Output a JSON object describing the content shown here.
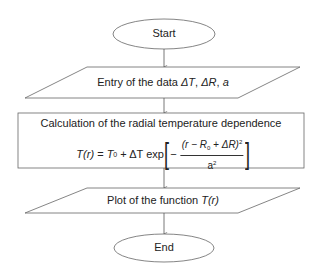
{
  "flowchart": {
    "nodes": [
      {
        "id": "start",
        "shape": "terminator",
        "label": "Start"
      },
      {
        "id": "input",
        "shape": "input-output",
        "label": "Entry of the data ΔT, ΔR, a",
        "label_parts": {
          "prefix": "Entry of the data ",
          "var1": "ΔT",
          "sep1": ", ",
          "var2": "ΔR",
          "sep2": ", ",
          "var3": "a"
        }
      },
      {
        "id": "process",
        "shape": "process",
        "label": "Calculation of the radial temperature dependence",
        "formula": {
          "lhs": "T(r)",
          "equals": " = ",
          "t0": "T",
          "t0_sub": "0",
          "plus": " + ΔT exp",
          "minus": "−",
          "numerator": "(r − R",
          "numerator_sub": "0",
          "numerator_tail": " + ΔR)",
          "numerator_sup": "2",
          "denominator": "a",
          "denominator_sup": "2",
          "text": "T(r) = T0 + ΔT exp[ −(r − R0 + ΔR)^2 / a^2 ]"
        }
      },
      {
        "id": "output",
        "shape": "input-output",
        "label": "Plot of the function T(r)",
        "label_parts": {
          "prefix": "Plot of the function ",
          "fn": "T(r)"
        }
      },
      {
        "id": "end",
        "shape": "terminator",
        "label": "End"
      }
    ],
    "edges": [
      {
        "from": "start",
        "to": "input"
      },
      {
        "from": "input",
        "to": "process"
      },
      {
        "from": "process",
        "to": "output"
      },
      {
        "from": "output",
        "to": "end"
      }
    ]
  },
  "colors": {
    "stroke": "#555555",
    "text": "#222222",
    "background": "#ffffff"
  }
}
